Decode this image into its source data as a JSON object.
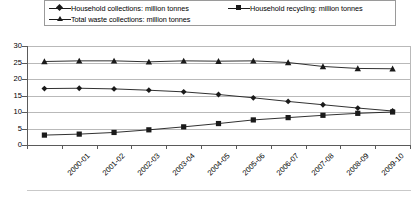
{
  "legend": {
    "position": "top",
    "entries": [
      {
        "label": "Household collections: million tonnes",
        "marker": "diamond-marker-icon"
      },
      {
        "label": "Household recycling: million tonnes",
        "marker": "square-marker-icon"
      },
      {
        "label": "Total waste collections: million tonnes",
        "marker": "triangle-marker-icon"
      }
    ]
  },
  "axis": {
    "y_ticks": [
      "30",
      "25",
      "20",
      "15",
      "10",
      "5",
      "0"
    ],
    "x_ticks": [
      "2000-01",
      "2001-02",
      "2002-03",
      "2003-04",
      "2004-05",
      "2005-06",
      "2006-07",
      "2007-08",
      "2008-09",
      "2009-10",
      "2010-11"
    ]
  },
  "colors": {
    "series": "#1a1a1a",
    "grid": "#b9b9b9",
    "axis": "#5a5a5a",
    "legend_border": "#9a9a9a",
    "background": "#ffffff"
  },
  "chart_data": {
    "type": "line",
    "title": "",
    "subtitle": "",
    "xlabel": "",
    "ylabel": "",
    "ylim": [
      0,
      30
    ],
    "ytick_step": 5,
    "grid": true,
    "legend_position": "top",
    "categories": [
      "2000-01",
      "2001-02",
      "2002-03",
      "2003-04",
      "2004-05",
      "2005-06",
      "2006-07",
      "2007-08",
      "2008-09",
      "2009-10",
      "2010-11"
    ],
    "series": [
      {
        "name": "Household collections: million tonnes",
        "marker": "diamond",
        "values": [
          17.1,
          17.2,
          17.0,
          16.6,
          16.1,
          15.3,
          14.3,
          13.2,
          12.2,
          11.2,
          10.3
        ]
      },
      {
        "name": "Household recycling: million tonnes",
        "marker": "square",
        "values": [
          3.0,
          3.3,
          3.8,
          4.6,
          5.5,
          6.5,
          7.6,
          8.3,
          9.0,
          9.6,
          10.0
        ]
      },
      {
        "name": "Total waste collections: million tonnes",
        "marker": "triangle",
        "values": [
          25.3,
          25.5,
          25.5,
          25.2,
          25.5,
          25.4,
          25.5,
          25.0,
          23.8,
          23.2,
          23.1
        ]
      }
    ]
  }
}
